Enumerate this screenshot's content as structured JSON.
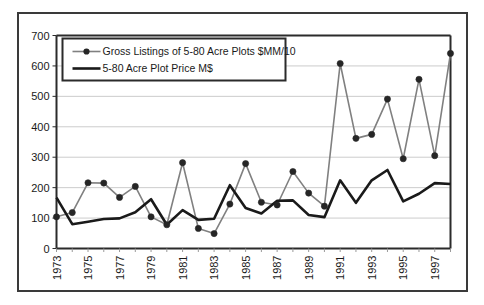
{
  "chart_data": {
    "type": "line",
    "title": "",
    "subtitle": "",
    "xlabel": "",
    "ylabel": "",
    "ylim": [
      0,
      700
    ],
    "ytick_step": 100,
    "yticks": [
      "0",
      "100",
      "200",
      "300",
      "400",
      "500",
      "600",
      "700"
    ],
    "grid": true,
    "grid_axis": "y",
    "legend_position": "top-left-inside",
    "x": [
      1973,
      1974,
      1975,
      1976,
      1977,
      1978,
      1979,
      1980,
      1981,
      1982,
      1983,
      1984,
      1985,
      1986,
      1987,
      1988,
      1989,
      1990,
      1991,
      1992,
      1993,
      1994,
      1995,
      1996,
      1997,
      1998
    ],
    "xtick_labels": [
      "1973",
      "1975",
      "1977",
      "1979",
      "1981",
      "1983",
      "1985",
      "1987",
      "1989",
      "1991",
      "1993",
      "1995",
      "1997"
    ],
    "xtick_values": [
      1973,
      1975,
      1977,
      1979,
      1981,
      1983,
      1985,
      1987,
      1989,
      1991,
      1993,
      1995,
      1997
    ],
    "series": [
      {
        "name": "Gross Listings of 5-80 Acre Plots $MM/10",
        "color": "#808080",
        "marker": "filled-circle",
        "marker_color": "#262626",
        "line_width": 1.6,
        "values": [
          104,
          118,
          216,
          215,
          168,
          204,
          104,
          78,
          282,
          66,
          49,
          146,
          279,
          152,
          143,
          253,
          182,
          139,
          608,
          362,
          375,
          491,
          295,
          556,
          305,
          641
        ]
      },
      {
        "name": "5-80 Acre Plot Price M$",
        "color": "#1a1a1a",
        "marker": "none",
        "line_width": 2.6,
        "values": [
          167,
          80,
          88,
          97,
          99,
          119,
          162,
          78,
          126,
          94,
          98,
          208,
          133,
          115,
          157,
          158,
          110,
          103,
          224,
          150,
          224,
          258,
          155,
          180,
          215,
          212
        ]
      }
    ],
    "axis_color": "#2b2b2b",
    "gridline_color": "#cccccc",
    "plot_background": "#ffffff"
  },
  "legend": {
    "entries": [
      {
        "label": "Gross Listings of 5-80 Acre Plots $MM/10",
        "swatch": "line-with-marker"
      },
      {
        "label": "5-80 Acre Plot Price M$",
        "swatch": "thick-line"
      }
    ]
  },
  "frame": {
    "border_color": "#3a3a3a"
  }
}
